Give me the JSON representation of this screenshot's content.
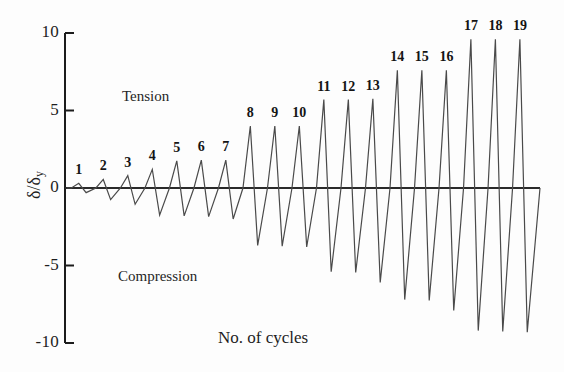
{
  "chart_data": {
    "type": "line",
    "title": "",
    "xlabel": "No. of cycles",
    "ylabel": "δ/δy",
    "ylim": [
      -10,
      10
    ],
    "yticks": [
      10,
      5,
      0,
      -5,
      -10
    ],
    "ytick_labels": [
      "10",
      "5",
      "0",
      "-5",
      "-10"
    ],
    "xaxis_visible": false,
    "grid": false,
    "legend": null,
    "annotations": [
      {
        "name": "tension-label",
        "text": "Tension",
        "x_px": 122,
        "y_px": 88
      },
      {
        "name": "compression-label",
        "text": "Compression",
        "x_px": 118,
        "y_px": 268
      }
    ],
    "series": [
      {
        "name": "cyclic displacement history",
        "color": "#4a4a4a",
        "cycles": [
          {
            "cycle": 1,
            "label": "1",
            "peak": 0.3,
            "trough": -0.3
          },
          {
            "cycle": 2,
            "label": "2",
            "peak": 0.55,
            "trough": -0.75
          },
          {
            "cycle": 3,
            "label": "3",
            "peak": 0.8,
            "trough": -1.05
          },
          {
            "cycle": 4,
            "label": "4",
            "peak": 1.2,
            "trough": -1.75
          },
          {
            "cycle": 5,
            "label": "5",
            "peak": 1.75,
            "trough": -1.8
          },
          {
            "cycle": 6,
            "label": "6",
            "peak": 1.8,
            "trough": -1.85
          },
          {
            "cycle": 7,
            "label": "7",
            "peak": 1.8,
            "trough": -2.0
          },
          {
            "cycle": 8,
            "label": "8",
            "peak": 4.0,
            "trough": -3.7
          },
          {
            "cycle": 9,
            "label": "9",
            "peak": 4.0,
            "trough": -3.75
          },
          {
            "cycle": 10,
            "label": "10",
            "peak": 4.0,
            "trough": -3.8
          },
          {
            "cycle": 11,
            "label": "11",
            "peak": 5.7,
            "trough": -5.4
          },
          {
            "cycle": 12,
            "label": "12",
            "peak": 5.7,
            "trough": -5.45
          },
          {
            "cycle": 13,
            "label": "13",
            "peak": 5.75,
            "trough": -6.1
          },
          {
            "cycle": 14,
            "label": "14",
            "peak": 7.6,
            "trough": -7.2
          },
          {
            "cycle": 15,
            "label": "15",
            "peak": 7.6,
            "trough": -7.25
          },
          {
            "cycle": 16,
            "label": "16",
            "peak": 7.6,
            "trough": -7.9
          },
          {
            "cycle": 17,
            "label": "17",
            "peak": 9.6,
            "trough": -9.2
          },
          {
            "cycle": 18,
            "label": "18",
            "peak": 9.6,
            "trough": -9.25
          },
          {
            "cycle": 19,
            "label": "19",
            "peak": 9.6,
            "trough": -9.3
          }
        ]
      }
    ]
  },
  "axes": {
    "y_axis_x_px": 65,
    "y_top_px": 33,
    "y_bottom_px": 343,
    "zero_px": 188,
    "plot_right_px": 540,
    "baseline_end_px": 540
  },
  "style": {
    "line_color": "#4a4a4a",
    "axis_color": "#1c1c1c",
    "text_color": "#1e1e1e",
    "background": "#fdfdfd"
  }
}
